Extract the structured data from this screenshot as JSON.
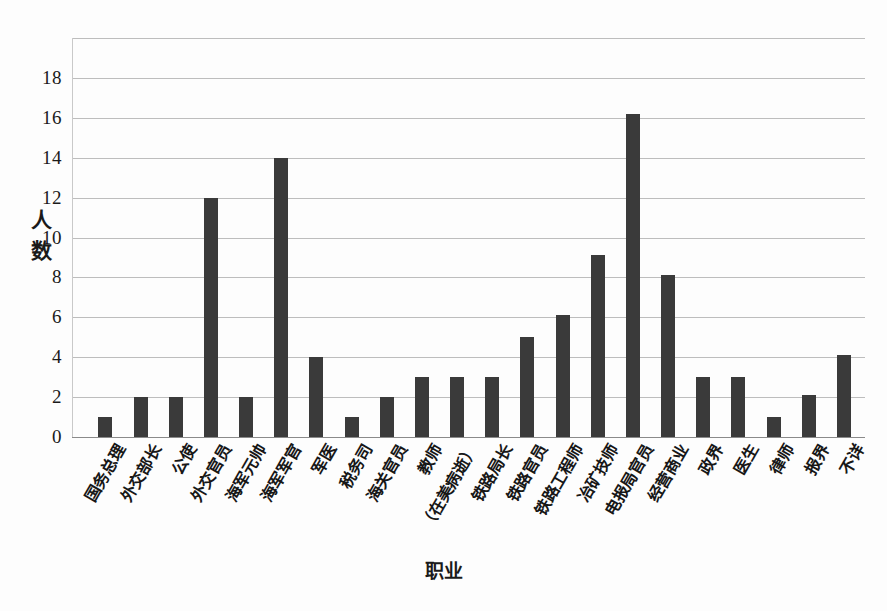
{
  "chart_data": {
    "type": "bar",
    "title": "",
    "xlabel": "职业",
    "ylabel": "人数",
    "ylim": [
      0,
      20
    ],
    "ytick_values": [
      0,
      2,
      4,
      6,
      8,
      10,
      12,
      14,
      16,
      18
    ],
    "ytick_labels": [
      "0",
      "2",
      "4",
      "6",
      "8",
      "10",
      "12",
      "14",
      "16",
      "18"
    ],
    "grid": true,
    "legend": "none",
    "bar_color": "#3a3a3a",
    "gridline_color": "#bdbdbd",
    "categories": [
      "国务总理",
      "外交部长",
      "公使",
      "外交官员",
      "海军元帅",
      "海军军官",
      "军医",
      "税务司",
      "海关官员",
      "教师",
      "（在美病逝）",
      "铁路局长",
      "铁路官员",
      "铁路工程师",
      "冶矿技师",
      "电报局官员",
      "经营商业",
      "政界",
      "医生",
      "律师",
      "报界",
      "不详"
    ],
    "values": [
      1,
      2,
      2,
      12,
      2,
      14,
      4,
      1,
      2,
      3,
      3,
      3,
      5,
      6.1,
      9.1,
      16.2,
      8.1,
      3,
      3,
      1,
      2.1,
      4.1
    ]
  }
}
